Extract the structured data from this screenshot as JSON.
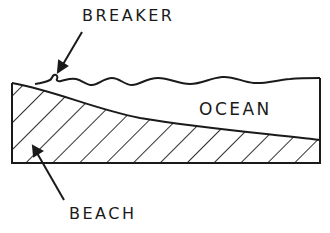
{
  "diagram": {
    "type": "cross-section",
    "labels": {
      "breaker": "BREAKER",
      "ocean": "OCEAN",
      "beach": "BEACH"
    },
    "colors": {
      "line": "#1a1a1a",
      "background": "#ffffff"
    },
    "fill_pattern": "diagonal-hatch"
  }
}
